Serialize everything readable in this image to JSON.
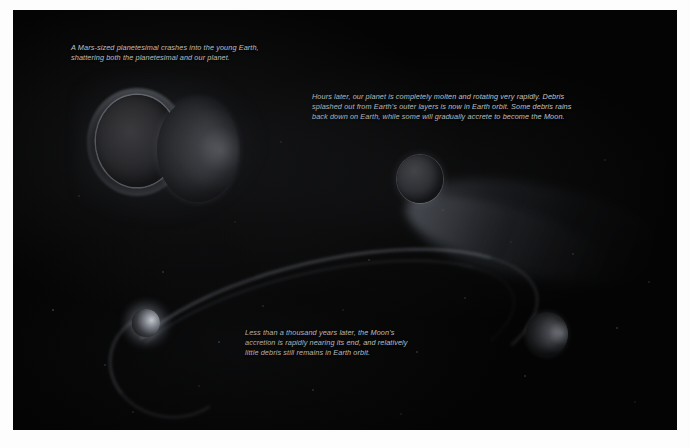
{
  "figure": {
    "background_color": "#040404",
    "caption_color": "#c9cbce"
  },
  "captions": [
    {
      "id": "impact",
      "text": "A Mars-sized planetesimal crashes into the young Earth,\nshattering both the planetesimal and our planet."
    },
    {
      "id": "molten",
      "text": "Hours later, our planet is completely molten and rotating very rapidly. Debris\nsplashed out from Earth's outer layers is now in Earth orbit. Some debris rains\nback down on Earth, while some will gradually accrete to become the Moon."
    },
    {
      "id": "accretion",
      "text": "Less than a thousand years later, the Moon's\naccretion is rapidly nearing its end, and relatively\nlittle debris still remains in Earth orbit."
    }
  ],
  "bodies": [
    {
      "id": "planetesimal",
      "label": "Mars-sized planetesimal"
    },
    {
      "id": "earth-impact",
      "label": "Young Earth at impact"
    },
    {
      "id": "molten-earth",
      "label": "Molten rotating Earth"
    },
    {
      "id": "young-earth",
      "label": "Earth with debris ring"
    },
    {
      "id": "moon-accreted",
      "label": "Accreting Moon"
    }
  ]
}
